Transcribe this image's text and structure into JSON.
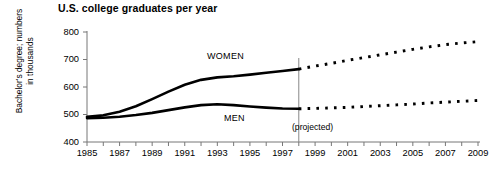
{
  "chart_data": {
    "type": "line",
    "title": "U.S. college graduates per year",
    "xlabel": "",
    "ylabel": "Bachelor's degree; numbers in thousands",
    "ylabel_line1": "Bachelor's degree; numbers",
    "ylabel_line2": "in thousands",
    "ylim": [
      400,
      800
    ],
    "xlim": [
      1985,
      2009
    ],
    "yticks": [
      400,
      500,
      600,
      700,
      800
    ],
    "ytick_labels": [
      "400",
      "500",
      "600",
      "700",
      "800"
    ],
    "xticks": [
      1985,
      1986,
      1987,
      1988,
      1989,
      1990,
      1991,
      1992,
      1993,
      1994,
      1995,
      1996,
      1997,
      1998,
      1999,
      2000,
      2001,
      2002,
      2003,
      2004,
      2005,
      2006,
      2007,
      2008,
      2009
    ],
    "xtick_labels_shown": [
      "1985",
      "1987",
      "1989",
      "1991",
      "1993",
      "1995",
      "1997",
      "1999",
      "2001",
      "2003",
      "2005",
      "2007",
      "2009"
    ],
    "grid": false,
    "legend": "inline-annotations",
    "annotations": [
      "WOMEN",
      "MEN",
      "(projected)"
    ],
    "projection_start_year": 1998,
    "divider_year": 1998,
    "series": [
      {
        "name": "WOMEN",
        "style": "solid-then-dotted",
        "x": [
          1985,
          1986,
          1987,
          1988,
          1989,
          1990,
          1991,
          1992,
          1993,
          1994,
          1995,
          1996,
          1997,
          1998
        ],
        "values": [
          492,
          497,
          510,
          530,
          556,
          583,
          608,
          626,
          635,
          639,
          645,
          652,
          658,
          665
        ],
        "projected_x": [
          1998,
          1999,
          2000,
          2001,
          2002,
          2003,
          2004,
          2005,
          2006,
          2007,
          2008,
          2009
        ],
        "projected_values": [
          665,
          676,
          686,
          697,
          707,
          717,
          727,
          737,
          746,
          754,
          760,
          765
        ]
      },
      {
        "name": "MEN",
        "style": "solid-then-dotted",
        "x": [
          1985,
          1986,
          1987,
          1988,
          1989,
          1990,
          1991,
          1992,
          1993,
          1994,
          1995,
          1996,
          1997,
          1998
        ],
        "values": [
          487,
          488,
          492,
          498,
          506,
          516,
          526,
          534,
          537,
          534,
          529,
          525,
          522,
          521
        ],
        "projected_x": [
          1998,
          1999,
          2000,
          2001,
          2002,
          2003,
          2004,
          2005,
          2006,
          2007,
          2008,
          2009
        ],
        "projected_values": [
          521,
          522,
          524,
          526,
          529,
          532,
          535,
          538,
          542,
          545,
          548,
          551
        ]
      }
    ]
  },
  "labels": {
    "women": "WOMEN",
    "men": "MEN",
    "projected": "(projected)"
  },
  "colors": {
    "line": "#000000",
    "axis": "#777777",
    "background": "#ffffff"
  }
}
